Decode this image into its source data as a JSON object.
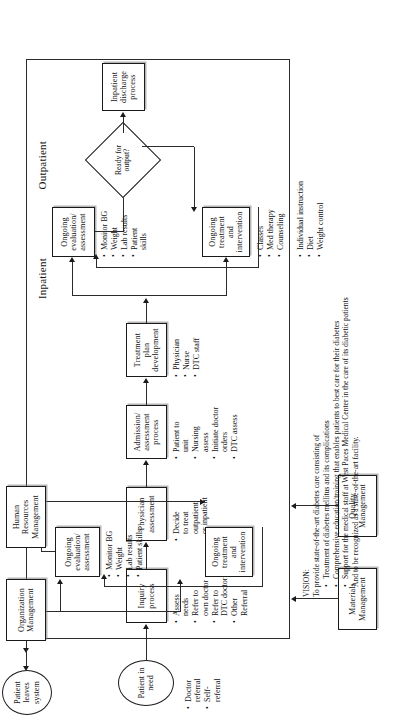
{
  "diagram": {
    "start_node": {
      "label": "Patient\nin need",
      "lines": [
        "Patient",
        "in need"
      ]
    },
    "end_node": {
      "label": "Patient\nleaves\nsystem",
      "lines": [
        "Patient",
        "leaves",
        "system"
      ]
    },
    "start_bullets": [
      "Doctor\nreferral",
      "Self-\nreferral"
    ],
    "start_bullet_lines": [
      [
        "Doctor",
        "referral"
      ],
      [
        "Self-",
        "referral"
      ]
    ],
    "sections": {
      "outpatient": "Outpatient",
      "inpatient": "Inpatient"
    },
    "support_boxes": {
      "materials": [
        "Materials",
        "Management"
      ],
      "quality": [
        "Quality",
        "Management"
      ],
      "human_resources": [
        "Human",
        "Resources",
        "Management"
      ],
      "organization": [
        "Organization",
        "Management"
      ]
    },
    "process_boxes": {
      "inquiry": [
        "Inquiry",
        "process"
      ],
      "physician_assessment": [
        "Physician",
        "assessment"
      ],
      "admission": [
        "Admission/",
        "assessment",
        "process"
      ],
      "treatment_plan": [
        "Treatment",
        "plan",
        "development"
      ],
      "inpatient_eval": [
        "Ongoing",
        "evaluation/",
        "assessment"
      ],
      "inpatient_treat": [
        "Ongoing",
        "treatment",
        "and",
        "intervention"
      ],
      "discharge": [
        "Inpatient",
        "discharge",
        "process"
      ],
      "outpatient_eval": [
        "Ongoing",
        "evaluation/",
        "assessment"
      ],
      "outpatient_treat": [
        "Ongoing",
        "treatment",
        "and",
        "intervention"
      ]
    },
    "decision": {
      "lines": [
        "Ready",
        "for",
        "output?"
      ]
    },
    "bullet_lists": {
      "inquiry": [
        [
          "Assess",
          "needs"
        ],
        [
          "Refer to",
          "own doctor"
        ],
        [
          "Refer to",
          "DTC doctor"
        ],
        [
          "Other",
          "Referral"
        ]
      ],
      "physician_assessment": [
        [
          "Decide",
          "to treat",
          "outpatient",
          "or inpatient"
        ]
      ],
      "admission": [
        [
          "Patient to",
          "unit"
        ],
        [
          "Nursing",
          "assess"
        ],
        [
          "Initiate doctor",
          "orders"
        ],
        [
          "DTC assess"
        ]
      ],
      "treatment_plan": [
        [
          "Physician"
        ],
        [
          "Nurse"
        ],
        [
          "DTC staff"
        ]
      ],
      "inpatient_eval": [
        [
          "Monitor BG"
        ],
        [
          "Weight"
        ],
        [
          "Lab results"
        ],
        [
          "Patient",
          "skills"
        ]
      ],
      "inpatient_treat_left": [
        [
          "Classes"
        ],
        [
          "Med therapy"
        ],
        [
          "Counseling"
        ]
      ],
      "inpatient_treat_right": [
        [
          "Individual instruction"
        ],
        [
          "Diet"
        ],
        [
          "Weight control"
        ]
      ],
      "outpatient_eval": [
        [
          "Monitor BG"
        ],
        [
          "Weight"
        ],
        [
          "Lab results"
        ],
        [
          "Patient skills"
        ]
      ]
    },
    "vision": {
      "title": "VISION:",
      "intro": "To provide state-of-the-art diabetes care consisting of",
      "bullets": [
        "Treatment of diabetes mellitus and its complications",
        "Comprehensive education/training that enables patients to best care for their diabetes",
        "Support for the medical staff at West Paces Medical Center in the care of its diabetic patients"
      ],
      "closing": "And to be recognized as a state-of-the-art facility."
    },
    "colors": {
      "line": "#2b2b2b",
      "box_border": "#1a1a1a",
      "background": "#ffffff",
      "shadow": "rgba(120,120,120,0.55)"
    }
  }
}
